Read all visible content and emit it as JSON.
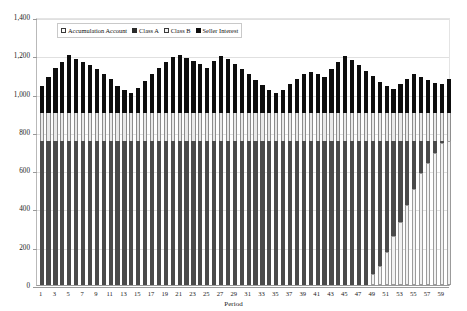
{
  "chart_data": {
    "type": "bar",
    "stacked": true,
    "title": "",
    "xlabel": "Period",
    "ylabel": "Million $",
    "ylim": [
      0,
      1400
    ],
    "ytick_step": 200,
    "ytick_labels": [
      "0",
      "200",
      "400",
      "600",
      "800",
      "1,000",
      "1,200",
      "1,400"
    ],
    "ytick_values": [
      0,
      200,
      400,
      600,
      800,
      1000,
      1200,
      1400
    ],
    "grid": true,
    "legend_position": "top-inside-left",
    "x": [
      1,
      2,
      3,
      4,
      5,
      6,
      7,
      8,
      9,
      10,
      11,
      12,
      13,
      14,
      15,
      16,
      17,
      18,
      19,
      20,
      21,
      22,
      23,
      24,
      25,
      26,
      27,
      28,
      29,
      30,
      31,
      32,
      33,
      34,
      35,
      36,
      37,
      38,
      39,
      40,
      41,
      42,
      43,
      44,
      45,
      46,
      47,
      48,
      49,
      50,
      51,
      52,
      53,
      54,
      55,
      56,
      57,
      58,
      59,
      60
    ],
    "xtick_labels": [
      "1",
      "3",
      "5",
      "7",
      "9",
      "11",
      "13",
      "15",
      "17",
      "19",
      "21",
      "23",
      "25",
      "27",
      "29",
      "31",
      "33",
      "35",
      "37",
      "39",
      "41",
      "43",
      "45",
      "47",
      "49",
      "51",
      "53",
      "55",
      "57",
      "59"
    ],
    "series": [
      {
        "name": "Accumulation Account",
        "color": "#f2f2f2",
        "values": [
          0,
          0,
          0,
          0,
          0,
          0,
          0,
          0,
          0,
          0,
          0,
          0,
          0,
          0,
          0,
          0,
          0,
          0,
          0,
          0,
          0,
          0,
          0,
          0,
          0,
          0,
          0,
          0,
          0,
          0,
          0,
          0,
          0,
          0,
          0,
          0,
          0,
          0,
          0,
          0,
          0,
          0,
          0,
          0,
          0,
          0,
          0,
          0,
          55,
          100,
          175,
          255,
          330,
          420,
          500,
          585,
          640,
          690,
          740,
          750
        ]
      },
      {
        "name": "Class A",
        "color": "#4a4a4a",
        "values": [
          750,
          750,
          750,
          750,
          750,
          750,
          750,
          750,
          750,
          750,
          750,
          750,
          750,
          750,
          750,
          750,
          750,
          750,
          750,
          750,
          750,
          750,
          750,
          750,
          750,
          750,
          750,
          750,
          750,
          750,
          750,
          750,
          750,
          750,
          750,
          750,
          750,
          750,
          750,
          750,
          750,
          750,
          750,
          750,
          750,
          750,
          750,
          750,
          695,
          650,
          575,
          495,
          420,
          330,
          250,
          165,
          110,
          60,
          10,
          0
        ]
      },
      {
        "name": "Class B",
        "color": "#e9e9e9",
        "values": [
          150,
          150,
          150,
          150,
          150,
          150,
          150,
          150,
          150,
          150,
          150,
          150,
          150,
          150,
          150,
          150,
          150,
          150,
          150,
          150,
          150,
          150,
          150,
          150,
          150,
          150,
          150,
          150,
          150,
          150,
          150,
          150,
          150,
          150,
          150,
          150,
          150,
          150,
          150,
          150,
          150,
          150,
          150,
          150,
          150,
          150,
          150,
          150,
          150,
          150,
          150,
          150,
          150,
          150,
          150,
          150,
          150,
          150,
          150,
          150
        ]
      },
      {
        "name": "Seller Interest",
        "color": "#0d0d0d",
        "values": [
          140,
          185,
          235,
          265,
          300,
          280,
          265,
          250,
          230,
          200,
          175,
          140,
          120,
          105,
          130,
          165,
          200,
          235,
          265,
          290,
          300,
          285,
          270,
          255,
          235,
          270,
          295,
          280,
          255,
          230,
          200,
          170,
          145,
          120,
          105,
          120,
          150,
          175,
          200,
          215,
          200,
          185,
          230,
          265,
          295,
          275,
          250,
          220,
          190,
          160,
          140,
          125,
          150,
          175,
          200,
          185,
          170,
          155,
          150,
          175
        ]
      }
    ]
  },
  "legend": {
    "items": [
      {
        "label": "Accumulation Account",
        "swatch": "acc"
      },
      {
        "label": "Class A",
        "swatch": "a"
      },
      {
        "label": "Class B",
        "swatch": "b"
      },
      {
        "label": "Seller Interest",
        "swatch": "s"
      }
    ]
  }
}
